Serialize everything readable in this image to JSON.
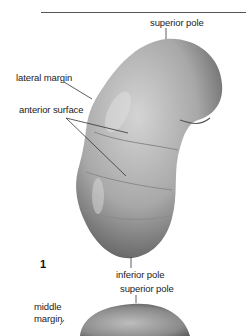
{
  "figure": {
    "number": "1",
    "labels": {
      "superior_pole_top": "superior pole",
      "lateral_margin": "lateral margin",
      "anterior_surface": "anterior surface",
      "inferior_pole": "inferior pole",
      "superior_pole_bottom": "superior pole",
      "middle_margin_line1": "middle",
      "middle_margin_line2": "margin"
    }
  },
  "colors": {
    "organ_light": "#c9c9c9",
    "organ_mid": "#9a9a9a",
    "organ_dark": "#4a4a4a",
    "leader_line": "#333333"
  }
}
